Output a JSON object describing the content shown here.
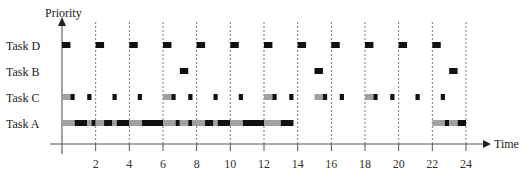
{
  "chart_data": {
    "type": "gantt-timeline",
    "title": "",
    "xlabel": "Time",
    "ylabel": "Priority",
    "xlim": [
      0,
      24
    ],
    "x_ticks": [
      2,
      4,
      6,
      8,
      10,
      12,
      14,
      16,
      18,
      20,
      22,
      24
    ],
    "grid": "vertical dashed lines at every even time unit 2..24",
    "rows": [
      "Task D",
      "Task B",
      "Task C",
      "Task A"
    ],
    "legend": {
      "black": "executing",
      "gray": "waiting/preempted (blocked)"
    },
    "segments": {
      "Task D": [
        {
          "start": 0.0,
          "end": 0.5,
          "color": "black"
        },
        {
          "start": 2.0,
          "end": 2.5,
          "color": "black"
        },
        {
          "start": 4.0,
          "end": 4.5,
          "color": "black"
        },
        {
          "start": 6.0,
          "end": 6.5,
          "color": "black"
        },
        {
          "start": 8.0,
          "end": 8.5,
          "color": "black"
        },
        {
          "start": 10.0,
          "end": 10.5,
          "color": "black"
        },
        {
          "start": 12.0,
          "end": 12.5,
          "color": "black"
        },
        {
          "start": 14.0,
          "end": 14.5,
          "color": "black"
        },
        {
          "start": 16.0,
          "end": 16.5,
          "color": "black"
        },
        {
          "start": 18.0,
          "end": 18.5,
          "color": "black"
        },
        {
          "start": 20.0,
          "end": 20.5,
          "color": "black"
        },
        {
          "start": 22.0,
          "end": 22.5,
          "color": "black"
        }
      ],
      "Task B": [
        {
          "start": 7.0,
          "end": 7.5,
          "color": "black"
        },
        {
          "start": 15.0,
          "end": 15.5,
          "color": "black"
        },
        {
          "start": 23.0,
          "end": 23.5,
          "color": "black"
        }
      ],
      "Task C": [
        {
          "start": 0.0,
          "end": 0.5,
          "color": "gray"
        },
        {
          "start": 0.5,
          "end": 0.75,
          "color": "black"
        },
        {
          "start": 1.5,
          "end": 1.75,
          "color": "black"
        },
        {
          "start": 3.0,
          "end": 3.25,
          "color": "black"
        },
        {
          "start": 4.5,
          "end": 4.75,
          "color": "black"
        },
        {
          "start": 6.0,
          "end": 6.5,
          "color": "gray"
        },
        {
          "start": 6.5,
          "end": 6.75,
          "color": "black"
        },
        {
          "start": 7.5,
          "end": 7.75,
          "color": "black"
        },
        {
          "start": 9.0,
          "end": 9.25,
          "color": "black"
        },
        {
          "start": 10.5,
          "end": 10.75,
          "color": "black"
        },
        {
          "start": 12.0,
          "end": 12.5,
          "color": "gray"
        },
        {
          "start": 12.5,
          "end": 12.75,
          "color": "black"
        },
        {
          "start": 13.5,
          "end": 13.75,
          "color": "black"
        },
        {
          "start": 15.0,
          "end": 15.5,
          "color": "gray"
        },
        {
          "start": 15.5,
          "end": 15.75,
          "color": "black"
        },
        {
          "start": 16.5,
          "end": 16.75,
          "color": "black"
        },
        {
          "start": 18.0,
          "end": 18.5,
          "color": "gray"
        },
        {
          "start": 18.5,
          "end": 18.75,
          "color": "black"
        },
        {
          "start": 19.5,
          "end": 19.75,
          "color": "black"
        },
        {
          "start": 21.0,
          "end": 21.25,
          "color": "black"
        },
        {
          "start": 22.5,
          "end": 22.75,
          "color": "black"
        }
      ],
      "Task A": [
        {
          "start": 0.0,
          "end": 0.75,
          "color": "gray"
        },
        {
          "start": 0.75,
          "end": 1.5,
          "color": "black"
        },
        {
          "start": 1.5,
          "end": 1.75,
          "color": "gray"
        },
        {
          "start": 1.75,
          "end": 2.0,
          "color": "black"
        },
        {
          "start": 2.0,
          "end": 2.5,
          "color": "gray"
        },
        {
          "start": 2.5,
          "end": 3.0,
          "color": "black"
        },
        {
          "start": 3.0,
          "end": 3.25,
          "color": "gray"
        },
        {
          "start": 3.25,
          "end": 4.0,
          "color": "black"
        },
        {
          "start": 4.0,
          "end": 4.75,
          "color": "gray"
        },
        {
          "start": 4.75,
          "end": 6.0,
          "color": "black"
        },
        {
          "start": 6.0,
          "end": 6.75,
          "color": "gray"
        },
        {
          "start": 6.75,
          "end": 7.0,
          "color": "black"
        },
        {
          "start": 7.0,
          "end": 7.5,
          "color": "gray"
        },
        {
          "start": 7.5,
          "end": 7.75,
          "color": "black"
        },
        {
          "start": 7.75,
          "end": 8.5,
          "color": "gray"
        },
        {
          "start": 8.5,
          "end": 9.0,
          "color": "black"
        },
        {
          "start": 9.0,
          "end": 9.25,
          "color": "gray"
        },
        {
          "start": 9.25,
          "end": 10.0,
          "color": "black"
        },
        {
          "start": 10.0,
          "end": 10.75,
          "color": "gray"
        },
        {
          "start": 10.75,
          "end": 12.0,
          "color": "black"
        },
        {
          "start": 12.0,
          "end": 13.0,
          "color": "gray"
        },
        {
          "start": 13.0,
          "end": 13.75,
          "color": "black"
        },
        {
          "start": 22.0,
          "end": 22.75,
          "color": "gray"
        },
        {
          "start": 22.75,
          "end": 23.0,
          "color": "black"
        },
        {
          "start": 23.0,
          "end": 23.5,
          "color": "gray"
        },
        {
          "start": 23.5,
          "end": 24.0,
          "color": "black"
        }
      ]
    }
  },
  "labels": {
    "y_axis": "Priority",
    "x_axis": "Time",
    "rows": [
      "Task D",
      "Task B",
      "Task C",
      "Task A"
    ]
  },
  "colors": {
    "run": "#111111",
    "wait": "#a0a0a0",
    "axis": "#555555",
    "grid": "#777777"
  }
}
